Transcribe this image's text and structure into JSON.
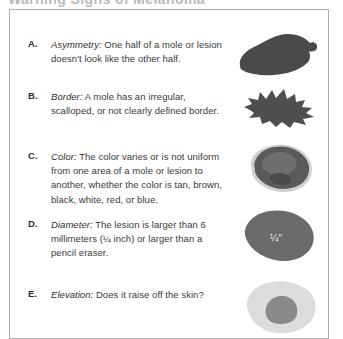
{
  "document": {
    "cut_off_heading": "Warning Signs of Melanoma",
    "background_color": "#ffffff",
    "border_color": "#b0b0b0",
    "text_color": "#3a3a3a"
  },
  "items": [
    {
      "letter": "A.",
      "term": "Asymmetry:",
      "text": " One half of a mole or lesion doesn't look like the other half.",
      "illustration": "asymmetric-lesion-shape",
      "illustration_color": "#4a4a4a"
    },
    {
      "letter": "B.",
      "term": "Border:",
      "text": " A mole has an irregular, scalloped, or not clearly defined border.",
      "illustration": "irregular-border-lesion-shape",
      "illustration_color": "#4f4f4f"
    },
    {
      "letter": "C.",
      "term": "Color:",
      "text": " The color varies or is not uniform from one area of a mole or lesion to another, whether the color is tan, brown, black, white, red, or blue.",
      "illustration": "varied-color-lesion-shape",
      "illustration_color": "#5a5a5a"
    },
    {
      "letter": "D.",
      "term": "Diameter:",
      "text": " The lesion is larger than 6 millimeters (¼ inch) or larger than a pencil eraser.",
      "illustration": "large-diameter-lesion-shape",
      "illustration_color": "#6a6a6a",
      "scale_label": "¼\""
    },
    {
      "letter": "E.",
      "term": "Elevation:",
      "text": " Does it raise off the skin?",
      "illustration": "elevated-lesion-shape",
      "illustration_color": "#d9d9d9"
    }
  ]
}
